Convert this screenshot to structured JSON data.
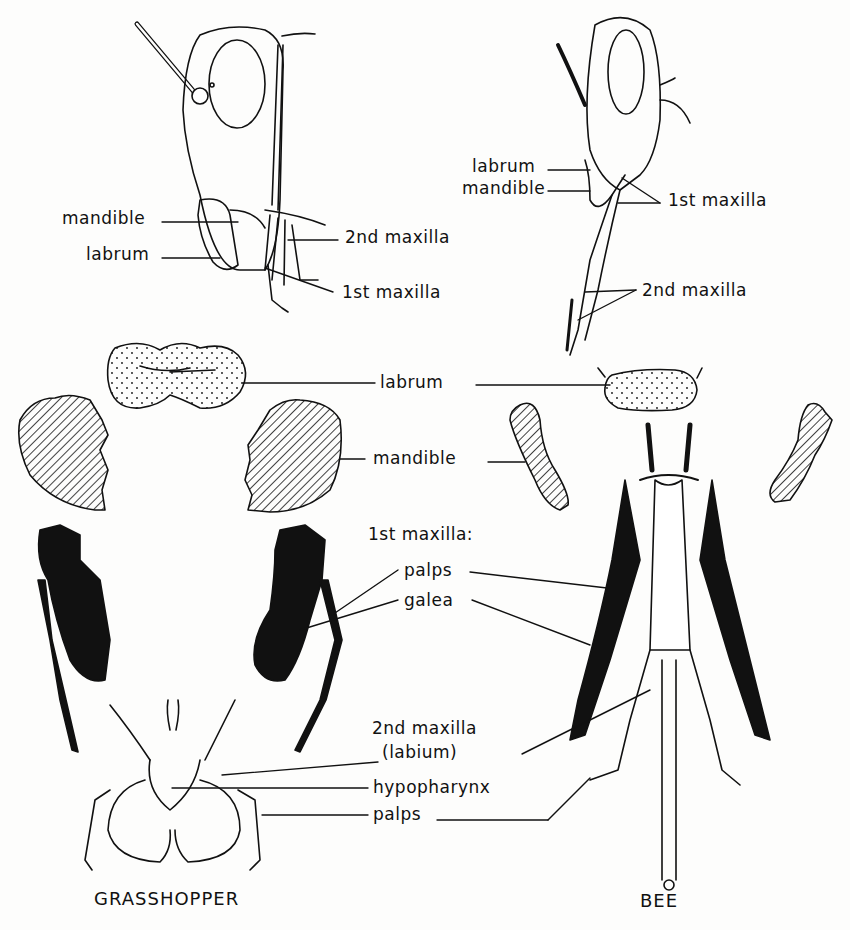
{
  "figure": {
    "subjects": [
      "GRASSHOPPER",
      "BEE"
    ],
    "colors": {
      "ink": "#111111",
      "paper": "#fdfdfc"
    }
  },
  "grasshopper_head": {
    "labels": {
      "mandible": "mandible",
      "labrum": "labrum",
      "second_maxilla": "2nd maxilla",
      "first_maxilla": "1st maxilla"
    }
  },
  "bee_head": {
    "labels": {
      "labrum": "labrum",
      "mandible": "mandible",
      "first_maxilla": "1st maxilla",
      "second_maxilla": "2nd maxilla"
    }
  },
  "parts": {
    "labrum": "labrum",
    "mandible": "mandible",
    "first_maxilla_heading": "1st maxilla:",
    "palps": "palps",
    "galea": "galea",
    "second_maxilla_line1": "2nd maxilla",
    "second_maxilla_line2": "(labium)",
    "hypopharynx": "hypopharynx",
    "labial_palps": "palps"
  },
  "captions": {
    "left": "GRASSHOPPER",
    "right": "BEE"
  }
}
